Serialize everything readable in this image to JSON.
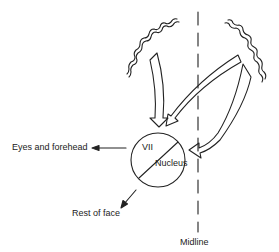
{
  "diagram": {
    "labels": {
      "eyes_forehead": "Eyes and forehead",
      "nucleus_top": "VII",
      "nucleus_bottom": "Nucleus",
      "rest_of_face": "Rest of face",
      "midline": "Midline"
    },
    "colors": {
      "ink": "#222222",
      "background": "#ffffff"
    },
    "elements": [
      "left-cortex-wavy-line",
      "right-cortex-wavy-line",
      "dashed-midline",
      "ipsilateral-descending-arrow",
      "crossing-arrow",
      "contralateral-curved-arrow",
      "vii-nucleus-circle",
      "nucleus-divider-line",
      "arrow-to-eyes-and-forehead",
      "arrow-to-rest-of-face"
    ]
  }
}
